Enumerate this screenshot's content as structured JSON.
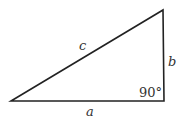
{
  "diagram": {
    "type": "right-triangle",
    "vertices": {
      "left": [
        11,
        101
      ],
      "right_angle": [
        164,
        101
      ],
      "top": [
        163,
        10
      ]
    },
    "labels": {
      "hypotenuse": "c",
      "vertical_leg": "b",
      "horizontal_leg": "a",
      "angle": "90°"
    },
    "colors": {
      "line": "#222222",
      "text": "#333333",
      "background": "#ffffff"
    }
  }
}
